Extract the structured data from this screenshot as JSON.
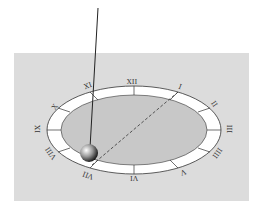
{
  "diagram": {
    "type": "pendulum over clock face",
    "numerals": [
      {
        "label": "XII",
        "x": 132,
        "y": 84,
        "rot": 0
      },
      {
        "label": "I",
        "x": 180,
        "y": 89,
        "rot": 20
      },
      {
        "label": "II",
        "x": 214,
        "y": 106,
        "rot": 55
      },
      {
        "label": "III",
        "x": 229,
        "y": 131,
        "rot": 90
      },
      {
        "label": "IIII",
        "x": 217,
        "y": 155,
        "rot": 125
      },
      {
        "label": "V",
        "x": 183,
        "y": 174,
        "rot": 160
      },
      {
        "label": "VI",
        "x": 134,
        "y": 180,
        "rot": 180
      },
      {
        "label": "VII",
        "x": 88,
        "y": 177,
        "rot": 200
      },
      {
        "label": "VIII",
        "x": 51,
        "y": 155,
        "rot": 235
      },
      {
        "label": "IX",
        "x": 38,
        "y": 131,
        "rot": 270
      },
      {
        "label": "X",
        "x": 55,
        "y": 109,
        "rot": 305
      },
      {
        "label": "XI",
        "x": 88,
        "y": 88,
        "rot": 340
      }
    ],
    "colors": {
      "panel": "#dcdcdc",
      "ring": "#ffffff",
      "inner": "#c8c8c8",
      "outline": "#333333"
    }
  }
}
